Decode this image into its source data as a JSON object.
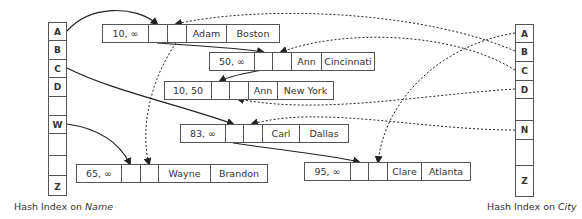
{
  "name_index": {
    "caption_prefix": "Hash Index on ",
    "caption_field": "Name",
    "cells": [
      "A",
      "B",
      "C",
      "D",
      "",
      "W",
      "",
      "",
      "Z"
    ]
  },
  "city_index": {
    "caption_prefix": "Hash Index on ",
    "caption_field": "City",
    "cells": [
      "A",
      "B",
      "C",
      "D",
      "",
      "N",
      "",
      "Z"
    ]
  },
  "records": [
    {
      "id": "adam",
      "range": "10, ∞",
      "name": "Adam",
      "city": "Boston"
    },
    {
      "id": "ann-cincinnati",
      "range": "50, ∞",
      "name": "Ann",
      "city": "Cincinnati"
    },
    {
      "id": "ann-newyork",
      "range": "10, 50",
      "name": "Ann",
      "city": "New York"
    },
    {
      "id": "carl",
      "range": "83, ∞",
      "name": "Carl",
      "city": "Dallas"
    },
    {
      "id": "wayne",
      "range": "65, ∞",
      "name": "Wayne",
      "city": "Brandon"
    },
    {
      "id": "clare",
      "range": "95, ∞",
      "name": "Clare",
      "city": "Atlanta"
    }
  ],
  "colors": {
    "line": "#222222",
    "box_border": "#555555",
    "text": "#333333"
  }
}
